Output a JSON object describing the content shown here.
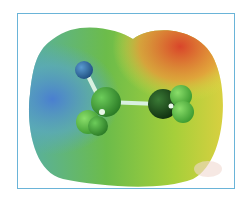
{
  "figure": {
    "type": "electrostatic-potential-map",
    "frame_border_color": "#6ab4d8",
    "surface_colors": {
      "negative_region": "#d9452a",
      "neutral_region": "#7cc23a",
      "intermediate_region": "#e0e04a",
      "positive_region": "#4a7fd0"
    },
    "atoms": [
      {
        "id": "atom-blue",
        "color": "#2f6fa8"
      },
      {
        "id": "atom-center-left",
        "color": "#3e9a35"
      },
      {
        "id": "atom-lower-left",
        "color": "#4dbb3f"
      },
      {
        "id": "atom-center-right",
        "color": "#1f4d1c"
      },
      {
        "id": "atom-right-a",
        "color": "#5ec24a"
      },
      {
        "id": "atom-right-b",
        "color": "#52b840"
      }
    ]
  }
}
